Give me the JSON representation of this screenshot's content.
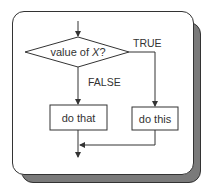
{
  "diagram": {
    "type": "flowchart",
    "decision": {
      "label_prefix": "value of ",
      "label_var": "X",
      "label_suffix": "?"
    },
    "branches": {
      "true_label": "TRUE",
      "false_label": "FALSE"
    },
    "actions": {
      "false_action": "do that",
      "true_action": "do this"
    },
    "colors": {
      "line": "#333333",
      "panel_bg": "#ffffff",
      "shadow": "#7a7a7a"
    }
  }
}
